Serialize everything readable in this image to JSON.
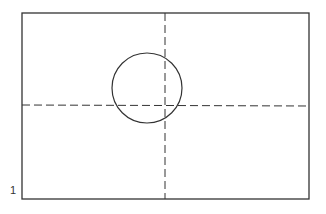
{
  "figure": {
    "label": "1",
    "frame": {
      "x": 22,
      "y": 13,
      "width": 287,
      "height": 186
    },
    "vertical_axis_x": 165,
    "horizontal_axis_y": 105,
    "circle": {
      "cx": 147,
      "cy": 88,
      "r": 35
    },
    "stroke_color": "#333333"
  }
}
